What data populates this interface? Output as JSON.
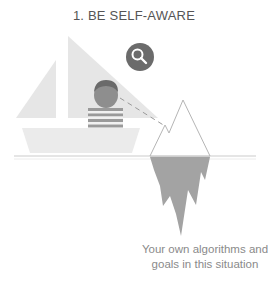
{
  "title": "1. BE SELF-AWARE",
  "caption": {
    "line1": "Your own algorithms and",
    "line2": "goals in this situation"
  },
  "icons": {
    "search": "magnifying-glass-icon"
  },
  "colors": {
    "sail": "#e6e6e6",
    "hull": "#e9e9e9",
    "badge": "#6b6b6b",
    "face": "#8c8c8c",
    "hair": "#6a6a6a",
    "iceberg_under": "#a3a3a3",
    "iceberg_outline": "#b5b5b5",
    "water": "#dcdcdc",
    "text": "#8a8a8a"
  }
}
